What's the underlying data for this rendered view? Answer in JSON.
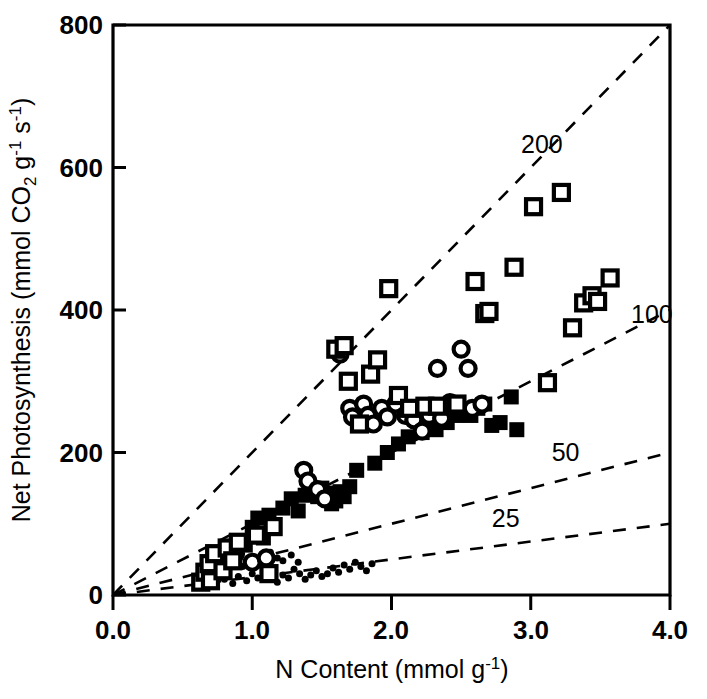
{
  "chart_data": {
    "type": "scatter",
    "title": "",
    "xlabel": "N Content (mmol g-1)",
    "xlabel_parts": {
      "main": "N Content (mmol",
      "symbol": " g",
      "exp": "-1",
      "close": ")"
    },
    "ylabel": "Net Photosynthesis (mmol CO2 g-1 s-1)",
    "ylabel_parts": {
      "p1": "Net Photosynthesis (mmol CO",
      "sub1": "2",
      "p2": " g",
      "sup1": "-1",
      "p3": " s",
      "sup2": "-1",
      "p4": ")"
    },
    "xlim": [
      0.0,
      4.0
    ],
    "ylim": [
      0,
      800
    ],
    "xticks": [
      "0.0",
      "1.0",
      "2.0",
      "3.0",
      "4.0"
    ],
    "xtick_values": [
      0.0,
      1.0,
      2.0,
      3.0,
      4.0
    ],
    "yticks": [
      "0",
      "200",
      "400",
      "600",
      "800"
    ],
    "ytick_values": [
      0,
      200,
      400,
      600,
      800
    ],
    "grid": false,
    "legend_position": "none",
    "reference_lines": [
      {
        "label": "200",
        "slope": 200,
        "label_x": 2.93,
        "label_y": 620
      },
      {
        "label": "100",
        "slope": 100,
        "label_x": 3.72,
        "label_y": 382
      },
      {
        "label": "50",
        "slope": 50,
        "label_x": 3.15,
        "label_y": 188
      },
      {
        "label": "25",
        "slope": 25,
        "label_x": 2.72,
        "label_y": 96
      }
    ],
    "series": [
      {
        "name": "open-squares",
        "marker": "open-square",
        "points": [
          [
            0.63,
            18
          ],
          [
            0.66,
            32
          ],
          [
            0.69,
            44
          ],
          [
            0.7,
            20
          ],
          [
            0.73,
            58
          ],
          [
            0.79,
            34
          ],
          [
            0.82,
            66
          ],
          [
            0.86,
            48
          ],
          [
            0.9,
            74
          ],
          [
            1.03,
            84
          ],
          [
            1.12,
            30
          ],
          [
            1.15,
            96
          ],
          [
            1.6,
            345
          ],
          [
            1.66,
            350
          ],
          [
            1.69,
            300
          ],
          [
            1.77,
            240
          ],
          [
            1.85,
            310
          ],
          [
            1.9,
            330
          ],
          [
            1.98,
            430
          ],
          [
            2.05,
            280
          ],
          [
            2.13,
            262
          ],
          [
            2.24,
            265
          ],
          [
            2.33,
            265
          ],
          [
            2.47,
            268
          ],
          [
            2.6,
            440
          ],
          [
            2.67,
            395
          ],
          [
            2.7,
            398
          ],
          [
            2.88,
            460
          ],
          [
            3.02,
            545
          ],
          [
            3.12,
            298
          ],
          [
            3.22,
            565
          ],
          [
            3.3,
            375
          ],
          [
            3.38,
            410
          ],
          [
            3.44,
            420
          ],
          [
            3.48,
            412
          ],
          [
            3.57,
            445
          ]
        ]
      },
      {
        "name": "open-circles",
        "marker": "open-circle",
        "points": [
          [
            0.88,
            58
          ],
          [
            1.0,
            46
          ],
          [
            1.1,
            52
          ],
          [
            1.37,
            175
          ],
          [
            1.4,
            160
          ],
          [
            1.63,
            338
          ],
          [
            1.7,
            262
          ],
          [
            1.72,
            250
          ],
          [
            1.8,
            268
          ],
          [
            1.83,
            252
          ],
          [
            1.87,
            240
          ],
          [
            1.93,
            262
          ],
          [
            1.97,
            250
          ],
          [
            2.03,
            268
          ],
          [
            2.1,
            252
          ],
          [
            2.16,
            246
          ],
          [
            2.22,
            230
          ],
          [
            2.27,
            252
          ],
          [
            2.33,
            318
          ],
          [
            2.36,
            248
          ],
          [
            2.42,
            270
          ],
          [
            2.45,
            268
          ],
          [
            2.5,
            345
          ],
          [
            2.55,
            318
          ],
          [
            2.58,
            262
          ],
          [
            2.65,
            268
          ],
          [
            1.47,
            148
          ],
          [
            1.52,
            135
          ]
        ]
      },
      {
        "name": "filled-squares",
        "marker": "filled-square",
        "points": [
          [
            0.68,
            28
          ],
          [
            0.78,
            50
          ],
          [
            0.88,
            62
          ],
          [
            0.95,
            70
          ],
          [
            1.0,
            95
          ],
          [
            1.04,
            108
          ],
          [
            1.08,
            80
          ],
          [
            1.12,
            112
          ],
          [
            1.22,
            122
          ],
          [
            1.28,
            135
          ],
          [
            1.33,
            118
          ],
          [
            1.38,
            140
          ],
          [
            1.43,
            145
          ],
          [
            1.47,
            138
          ],
          [
            1.5,
            150
          ],
          [
            1.53,
            143
          ],
          [
            1.57,
            128
          ],
          [
            1.6,
            132
          ],
          [
            1.63,
            145
          ],
          [
            1.66,
            138
          ],
          [
            1.7,
            152
          ],
          [
            1.75,
            175
          ],
          [
            1.88,
            185
          ],
          [
            1.97,
            200
          ],
          [
            2.05,
            212
          ],
          [
            2.12,
            222
          ],
          [
            2.22,
            228
          ],
          [
            2.32,
            232
          ],
          [
            2.4,
            242
          ],
          [
            2.47,
            252
          ],
          [
            2.52,
            258
          ],
          [
            2.57,
            252
          ],
          [
            2.62,
            262
          ],
          [
            2.67,
            268
          ],
          [
            2.72,
            238
          ],
          [
            2.78,
            242
          ],
          [
            2.86,
            278
          ],
          [
            2.9,
            232
          ]
        ]
      },
      {
        "name": "small-dots",
        "marker": "dot",
        "points": [
          [
            0.72,
            18
          ],
          [
            0.8,
            22
          ],
          [
            0.86,
            16
          ],
          [
            0.9,
            26
          ],
          [
            0.96,
            20
          ],
          [
            1.0,
            30
          ],
          [
            1.04,
            24
          ],
          [
            1.08,
            34
          ],
          [
            1.12,
            22
          ],
          [
            1.15,
            32
          ],
          [
            1.18,
            18
          ],
          [
            1.22,
            28
          ],
          [
            1.26,
            24
          ],
          [
            1.3,
            36
          ],
          [
            1.34,
            30
          ],
          [
            1.38,
            22
          ],
          [
            1.42,
            28
          ],
          [
            1.46,
            34
          ],
          [
            1.5,
            26
          ],
          [
            1.54,
            30
          ],
          [
            1.58,
            38
          ],
          [
            1.62,
            32
          ],
          [
            1.66,
            42
          ],
          [
            1.7,
            36
          ],
          [
            1.74,
            46
          ],
          [
            1.78,
            40
          ],
          [
            1.82,
            34
          ],
          [
            1.86,
            44
          ],
          [
            1.13,
            60
          ],
          [
            1.18,
            52
          ],
          [
            1.22,
            48
          ],
          [
            1.08,
            48
          ],
          [
            0.93,
            40
          ],
          [
            1.05,
            42
          ],
          [
            1.28,
            56
          ],
          [
            1.33,
            46
          ]
        ]
      }
    ]
  },
  "axes_geometry": {
    "plot_left_px": 113,
    "plot_right_px": 670,
    "plot_top_px": 25,
    "plot_bottom_px": 595
  }
}
